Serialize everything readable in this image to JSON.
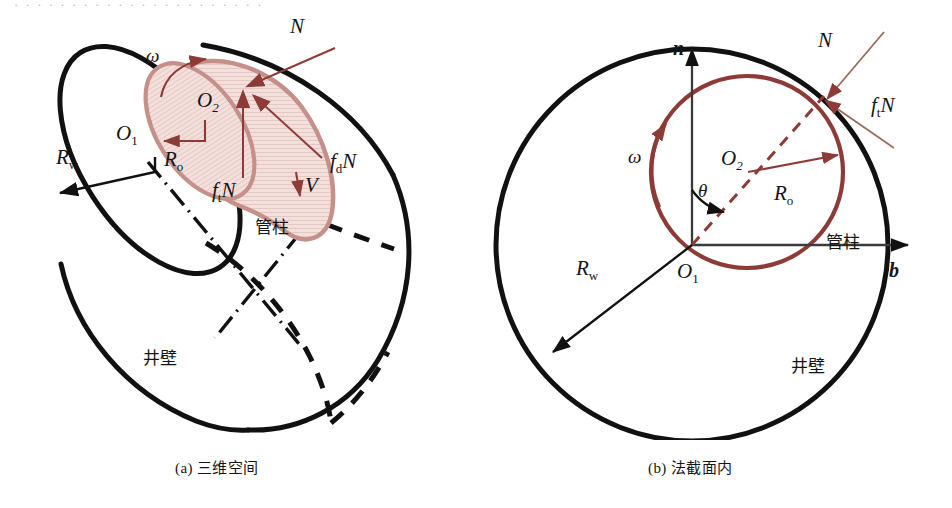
{
  "figure": {
    "type": "technical-diagram",
    "colors": {
      "outline": "#111111",
      "pipe_stroke": "#8d3b37",
      "pipe_fill": "#f2dedb",
      "pipe_hatch": "#dcb4ae",
      "force_arrow": "#8d3b37",
      "thin_leader": "#9c6a60",
      "axis": "#3a3a3a",
      "background": "#ffffff"
    },
    "top_sliver_text": "· · · · · · · · · · · · · · · · · · · · · ·"
  },
  "panels": [
    {
      "id": "a",
      "caption": "(a) 三维空间",
      "labels": {
        "omega": "ω",
        "O1": "O",
        "O1_sub": "1",
        "O2": "O",
        "O2_sub": "2",
        "Rw": "R",
        "Rw_sub": "w",
        "Ro": "R",
        "Ro_sub": "o",
        "N": "N",
        "ftN_f": "f",
        "ftN_sub": "t",
        "ftN_N": "N",
        "fdN_f": "f",
        "fdN_sub": "d",
        "fdN_N": "N",
        "V": "V",
        "pipe": "管柱",
        "wall": "井壁"
      }
    },
    {
      "id": "b",
      "caption": "(b) 法截面内",
      "labels": {
        "n_axis": "n",
        "b_axis": "b",
        "omega": "ω",
        "theta": "θ",
        "O1": "O",
        "O1_sub": "1",
        "O2": "O",
        "O2_sub": "2",
        "Rw": "R",
        "Rw_sub": "w",
        "Ro": "R",
        "Ro_sub": "o",
        "N": "N",
        "ftN_f": "f",
        "ftN_sub": "t",
        "ftN_N": "N",
        "pipe": "管柱",
        "wall": "井壁"
      }
    }
  ]
}
